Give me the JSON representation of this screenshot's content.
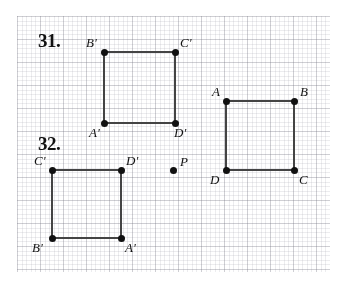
{
  "page": {
    "width": 340,
    "height": 282,
    "background_color": "#ffffff",
    "ink_color": "#111111",
    "grid": {
      "visible": true,
      "cell_px": 23,
      "left": 17,
      "top": 16,
      "width": 313,
      "height": 256,
      "line_color": "#aaaab4"
    }
  },
  "problems": [
    {
      "id": "problem-31",
      "number_label": "31.",
      "number_pos": {
        "x": 38,
        "y": 30
      }
    },
    {
      "id": "problem-32",
      "number_label": "32.",
      "number_pos": {
        "x": 38,
        "y": 133
      }
    }
  ],
  "figures": [
    {
      "id": "square-image-31",
      "name": "square-a-prime-b-prime-c-prime-d-prime-31",
      "problem": "31.",
      "kind": "square",
      "stroke_color": "#444444",
      "stroke_width": 2,
      "vertices": [
        {
          "label": "B'",
          "x": 104,
          "y": 52,
          "label_x": 86,
          "label_y": 36,
          "label_anchor": "above-left"
        },
        {
          "label": "C'",
          "x": 175,
          "y": 52,
          "label_x": 180,
          "label_y": 36,
          "label_anchor": "above-right"
        },
        {
          "label": "D'",
          "x": 175,
          "y": 123,
          "label_x": 174,
          "label_y": 126,
          "label_anchor": "below-right"
        },
        {
          "label": "A'",
          "x": 104,
          "y": 123,
          "label_x": 89,
          "label_y": 126,
          "label_anchor": "below-left"
        }
      ],
      "path_order": [
        "B'",
        "C'",
        "D'",
        "A'"
      ]
    },
    {
      "id": "square-image-32",
      "name": "square-a-prime-b-prime-c-prime-d-prime-32",
      "problem": "32.",
      "kind": "square",
      "stroke_color": "#444444",
      "stroke_width": 2,
      "vertices": [
        {
          "label": "C'",
          "x": 52,
          "y": 170,
          "label_x": 34,
          "label_y": 154,
          "label_anchor": "above-left"
        },
        {
          "label": "D'",
          "x": 121,
          "y": 170,
          "label_x": 126,
          "label_y": 154,
          "label_anchor": "above-right"
        },
        {
          "label": "A'",
          "x": 121,
          "y": 238,
          "label_x": 125,
          "label_y": 241,
          "label_anchor": "below-right"
        },
        {
          "label": "B'",
          "x": 52,
          "y": 238,
          "label_x": 32,
          "label_y": 241,
          "label_anchor": "below-left"
        }
      ],
      "path_order": [
        "C'",
        "D'",
        "A'",
        "B'"
      ]
    },
    {
      "id": "square-preimage-abcd",
      "name": "square-abcd-preimage",
      "problem": "shared",
      "kind": "square",
      "stroke_color": "#444444",
      "stroke_width": 2,
      "vertices": [
        {
          "label": "A",
          "x": 226,
          "y": 101,
          "label_x": 212,
          "label_y": 85,
          "label_anchor": "above-left"
        },
        {
          "label": "B",
          "x": 294,
          "y": 101,
          "label_x": 300,
          "label_y": 85,
          "label_anchor": "above-right"
        },
        {
          "label": "C",
          "x": 294,
          "y": 170,
          "label_x": 299,
          "label_y": 173,
          "label_anchor": "below-right"
        },
        {
          "label": "D",
          "x": 226,
          "y": 170,
          "label_x": 210,
          "label_y": 173,
          "label_anchor": "below-left"
        }
      ],
      "path_order": [
        "A",
        "B",
        "C",
        "D"
      ]
    }
  ],
  "points": [
    {
      "id": "point-p",
      "name": "center-of-rotation-point-p",
      "label": "P",
      "x": 173,
      "y": 170,
      "label_x": 180,
      "label_y": 155
    }
  ]
}
